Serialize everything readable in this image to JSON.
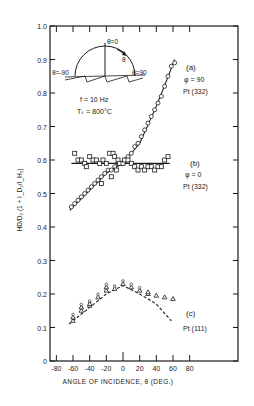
{
  "chart_data": {
    "type": "scatter",
    "title": "",
    "xlabel": "ANGLE OF INCIDENCE, θ (DEG.)",
    "ylabel": "HD/D₂ (1 + I_D₂/I_H₂)",
    "xlim": [
      -80,
      80
    ],
    "ylim": [
      0,
      1.0
    ],
    "x_ticks": [
      -80,
      -60,
      -40,
      -20,
      0,
      20,
      40,
      60,
      80
    ],
    "x_tick_labels": [
      "-80",
      "-60",
      "-40",
      "-20",
      "0",
      "20",
      "40",
      "60",
      "80"
    ],
    "y_ticks": [
      0,
      0.1,
      0.2,
      0.3,
      0.4,
      0.5,
      0.6,
      0.7,
      0.8,
      0.9,
      1.0
    ],
    "y_tick_labels": [
      "0",
      "0.1",
      "0.2",
      "0.3",
      "0.4",
      "0.5",
      "0.6",
      "0.7",
      "0.8",
      "0.9",
      "1.0"
    ],
    "grid": false,
    "conditions": {
      "frequency": "f = 10 Hz",
      "surface_temp": "Tₛ = 800°C"
    },
    "inset": {
      "label_top": "θ=0",
      "label_left": "θ=-90",
      "label_right": "θ=90",
      "label_arc": "θ"
    },
    "series": [
      {
        "name": "(a)",
        "params": "φ = 90",
        "surface": "Pt (332)",
        "marker": "circle",
        "fit": "solid",
        "x": [
          -62,
          -58,
          -54,
          -50,
          -46,
          -42,
          -38,
          -34,
          -30,
          -26,
          -22,
          -18,
          -14,
          -10,
          -6,
          -2,
          2,
          6,
          10,
          14,
          18,
          22,
          26,
          30,
          34,
          38,
          42,
          46,
          50,
          54,
          58,
          62
        ],
        "y": [
          0.46,
          0.47,
          0.48,
          0.49,
          0.5,
          0.51,
          0.52,
          0.53,
          0.54,
          0.55,
          0.56,
          0.57,
          0.57,
          0.58,
          0.59,
          0.59,
          0.6,
          0.61,
          0.62,
          0.64,
          0.65,
          0.67,
          0.69,
          0.71,
          0.73,
          0.75,
          0.77,
          0.79,
          0.82,
          0.85,
          0.88,
          0.89
        ],
        "fit_line": {
          "x": [
            -64,
            -20,
            0,
            20,
            40,
            56,
            62
          ],
          "y": [
            0.45,
            0.56,
            0.59,
            0.65,
            0.76,
            0.86,
            0.9
          ]
        }
      },
      {
        "name": "(b)",
        "params": "φ = 0",
        "surface": "Pt (332)",
        "marker": "square",
        "fit": "solid",
        "x": [
          -58,
          -54,
          -50,
          -46,
          -44,
          -40,
          -36,
          -32,
          -28,
          -24,
          -20,
          -16,
          -12,
          -10,
          -6,
          -4,
          0,
          2,
          6,
          10,
          14,
          18,
          22,
          26,
          30,
          34,
          38,
          42,
          46,
          50,
          54,
          -26,
          -14,
          -8
        ],
        "y": [
          0.62,
          0.6,
          0.6,
          0.59,
          0.58,
          0.61,
          0.6,
          0.6,
          0.59,
          0.6,
          0.59,
          0.62,
          0.62,
          0.61,
          0.6,
          0.59,
          0.59,
          0.6,
          0.6,
          0.59,
          0.58,
          0.57,
          0.58,
          0.57,
          0.58,
          0.58,
          0.57,
          0.58,
          0.58,
          0.6,
          0.61,
          0.53,
          0.55,
          0.57
        ],
        "fit_line": {
          "x": [
            -62,
            56
          ],
          "y": [
            0.59,
            0.59
          ]
        }
      },
      {
        "name": "(c)",
        "params": "",
        "surface": "Pt (111)",
        "marker": "triangle-circle",
        "fit": "dashed",
        "x": [
          -60,
          -60,
          -50,
          -50,
          -40,
          -40,
          -30,
          -20,
          -20,
          -10,
          0,
          10,
          20,
          30,
          30,
          40,
          50,
          60
        ],
        "y": [
          0.12,
          0.13,
          0.15,
          0.16,
          0.165,
          0.17,
          0.19,
          0.21,
          0.22,
          0.215,
          0.23,
          0.22,
          0.21,
          0.2,
          0.205,
          0.195,
          0.19,
          0.185
        ],
        "fit_line": {
          "x": [
            -65,
            -40,
            -20,
            0,
            20,
            40,
            58
          ],
          "y": [
            0.11,
            0.16,
            0.2,
            0.225,
            0.2,
            0.17,
            0.12
          ]
        }
      }
    ]
  },
  "labels": {
    "a_name": "(a)",
    "a_param": "φ = 90",
    "a_surface": "Pt (332)",
    "b_name": "(b)",
    "b_param": "φ = 0",
    "b_surface": "Pt (332)",
    "c_name": "(c)",
    "c_surface": "Pt (111)"
  }
}
